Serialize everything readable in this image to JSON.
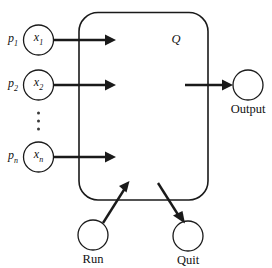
{
  "diagram": {
    "type": "automaton-block-diagram",
    "background_color": "#ffffff",
    "line_color": "#1a1a1a",
    "process": {
      "label": "Q",
      "shape": "rounded-rectangle"
    },
    "inputs": [
      {
        "prefix": "p",
        "prefix_sub": "1",
        "node": "x",
        "node_sub": "1"
      },
      {
        "prefix": "p",
        "prefix_sub": "2",
        "node": "x",
        "node_sub": "2"
      },
      {
        "prefix": "p",
        "prefix_sub": "n",
        "node": "x",
        "node_sub": "n"
      }
    ],
    "ellipsis": "⋮",
    "output": {
      "label": "Output"
    },
    "controls": [
      {
        "label": "Run",
        "direction": "into-process"
      },
      {
        "label": "Quit",
        "direction": "out-of-process"
      }
    ]
  }
}
